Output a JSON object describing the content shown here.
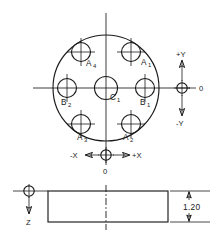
{
  "drawing": {
    "title": "Connector face and side view with hole positions",
    "views": {
      "face_view": {
        "name": "face-view",
        "outer_circle": {
          "cx": 106,
          "cy": 88,
          "r": 53
        },
        "center_hole": {
          "label": "C",
          "subscript": "1",
          "cx": 106,
          "cy": 88,
          "r": 11.5
        },
        "holes": [
          {
            "label": "A",
            "subscript": "1",
            "cx": 131,
            "cy": 52,
            "r": 9.5,
            "label_x": 141,
            "label_y": 65
          },
          {
            "label": "A",
            "subscript": "2",
            "cx": 131,
            "cy": 124,
            "r": 9.5,
            "label_x": 124,
            "label_y": 139
          },
          {
            "label": "A",
            "subscript": "3",
            "cx": 81,
            "cy": 124,
            "r": 9.5,
            "label_x": 76,
            "label_y": 139
          },
          {
            "label": "A",
            "subscript": "4",
            "cx": 81,
            "cy": 52,
            "r": 9.5,
            "label_x": 86,
            "label_y": 66
          },
          {
            "label": "B",
            "subscript": "1",
            "cx": 145,
            "cy": 88,
            "r": 9.5,
            "label_x": 141,
            "label_y": 104
          },
          {
            "label": "B",
            "subscript": "2",
            "cx": 67,
            "cy": 88,
            "r": 9.5,
            "label_x": 62,
            "label_y": 104
          }
        ],
        "horizontal_centerline": {
          "x1": 33,
          "y1": 88,
          "x2": 190,
          "y2": 88
        },
        "vertical_centerline": {
          "x1": 106,
          "y1": 13,
          "x2": 106,
          "y2": 165
        }
      },
      "side_view": {
        "name": "side-view",
        "rect": {
          "x": 48,
          "y": 191,
          "w": 120,
          "h": 31
        },
        "centerline": {
          "x": 106,
          "y1": 185,
          "y2": 230
        }
      }
    },
    "axis_indicators": {
      "y_axis": {
        "name": "y-axis-indicator",
        "origin_label": "0",
        "positive_label": "+Y",
        "negative_label": "-Y",
        "cx": 182,
        "cy": 88,
        "r": 5.2,
        "arrow_top_y": 62,
        "arrow_bottom_y": 114,
        "origin_label_x": 198,
        "origin_label_y": 91,
        "positive_label_x": 176,
        "positive_label_y": 58,
        "negative_label_x": 176,
        "negative_label_y": 124
      },
      "x_axis": {
        "name": "x-axis-indicator",
        "origin_label": "0",
        "positive_label": "+X",
        "negative_label": "-X",
        "cx": 106,
        "cy": 155,
        "r": 5.2,
        "arrow_left_x": 84,
        "arrow_right_x": 128,
        "origin_label_x": 106,
        "origin_label_y": 173,
        "positive_label_x": 132,
        "positive_label_y": 158,
        "negative_label_x": 78,
        "negative_label_y": 158
      },
      "z_axis": {
        "name": "z-axis-indicator",
        "label": "Z",
        "cx": 29,
        "cy": 191,
        "r": 5.2,
        "arrow_bottom_y": 212,
        "leader_x1": 13,
        "leader_x2": 48,
        "label_x": 29,
        "label_y": 224
      }
    },
    "dimensions": [
      {
        "name": "thickness-dimension",
        "value": "1.20",
        "label_x": 196,
        "label_y": 210,
        "ext_top_y": 191,
        "ext_bottom_y": 222,
        "ext_x1": 168,
        "ext_x2": 210,
        "dim_line_x": 189,
        "arrow_top_y": 191,
        "arrow_bottom_y": 222
      }
    ],
    "colors": {
      "line": "#1a1a1a",
      "background": "#ffffff"
    }
  }
}
